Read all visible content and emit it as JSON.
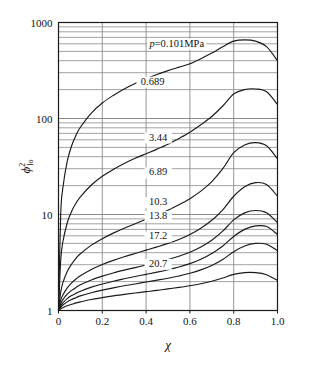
{
  "chart_data": {
    "type": "line",
    "title": "",
    "xlabel": "x",
    "ylabel": "phi^2_lo",
    "xlabel_glyph": "χ",
    "ylabel_glyph": "ϕ",
    "ylabel_sup": "2",
    "ylabel_sub": "lo",
    "xlim": [
      0,
      1.0
    ],
    "ylim": [
      1,
      1000
    ],
    "yscale": "log",
    "xscale": "linear",
    "grid": true,
    "grid_minor": true,
    "legend_position": "inline-curve-labels",
    "xticks": [
      "0",
      "0.2",
      "0.4",
      "0.6",
      "0.8",
      "1.0"
    ],
    "xtick_values": [
      0,
      0.2,
      0.4,
      0.6,
      0.8,
      1.0
    ],
    "yticks": [
      "1",
      "10",
      "100",
      "1000"
    ],
    "ytick_values": [
      1,
      10,
      100,
      1000
    ],
    "x": [
      0,
      0.01,
      0.02,
      0.04,
      0.06,
      0.08,
      0.1,
      0.15,
      0.2,
      0.25,
      0.3,
      0.35,
      0.4,
      0.45,
      0.5,
      0.55,
      0.6,
      0.65,
      0.7,
      0.75,
      0.8,
      0.85,
      0.9,
      0.95,
      1.0
    ],
    "series": [
      {
        "name": "p=0.101MPa",
        "label": "p=0.101MPa",
        "label_x": 0.54,
        "label_y": 560,
        "values": [
          1,
          10,
          19,
          36,
          52,
          67,
          81,
          114,
          145,
          174,
          203,
          231,
          259,
          287,
          315,
          343,
          372,
          420,
          480,
          560,
          640,
          660,
          640,
          560,
          400
        ]
      },
      {
        "name": "0.689",
        "label": "0.689",
        "label_x": 0.43,
        "label_y": 225,
        "values": [
          1,
          3.3,
          5.2,
          8.2,
          10.8,
          13.1,
          15.3,
          20.3,
          25.0,
          29.5,
          34.0,
          38.5,
          43.0,
          48.0,
          54.0,
          62.0,
          72.0,
          86.0,
          105.0,
          135.0,
          180.0,
          200.0,
          203.0,
          190.0,
          140.0
        ]
      },
      {
        "name": "3.44",
        "label": "3.44",
        "label_x": 0.455,
        "label_y": 59,
        "values": [
          1,
          1.55,
          1.95,
          2.55,
          3.05,
          3.5,
          3.9,
          4.8,
          5.6,
          6.4,
          7.2,
          8.0,
          8.9,
          9.9,
          11.1,
          12.6,
          14.6,
          17.5,
          22.0,
          30.0,
          44.0,
          53.0,
          56.0,
          52.0,
          38.0
        ]
      },
      {
        "name": "6.89",
        "label": "6.89",
        "label_x": 0.455,
        "label_y": 25.5,
        "values": [
          1,
          1.28,
          1.45,
          1.72,
          1.94,
          2.13,
          2.3,
          2.68,
          3.02,
          3.33,
          3.63,
          3.93,
          4.25,
          4.6,
          5.0,
          5.5,
          6.2,
          7.2,
          8.7,
          11.2,
          15.5,
          19.5,
          21.5,
          20.5,
          15.5
        ]
      },
      {
        "name": "10.3",
        "label": "10.3",
        "label_x": 0.455,
        "label_y": 12.5,
        "values": [
          1,
          1.18,
          1.3,
          1.48,
          1.62,
          1.74,
          1.85,
          2.08,
          2.28,
          2.46,
          2.63,
          2.8,
          2.98,
          3.18,
          3.4,
          3.68,
          4.05,
          4.6,
          5.4,
          6.7,
          8.8,
          10.4,
          11.0,
          10.4,
          8.2
        ]
      },
      {
        "name": "13.8",
        "label": "13.8",
        "label_x": 0.455,
        "label_y": 9.0,
        "values": [
          1,
          1.12,
          1.2,
          1.33,
          1.43,
          1.51,
          1.59,
          1.75,
          1.89,
          2.02,
          2.14,
          2.26,
          2.38,
          2.51,
          2.66,
          2.84,
          3.08,
          3.42,
          3.92,
          4.7,
          5.9,
          7.0,
          7.6,
          7.5,
          6.2
        ]
      },
      {
        "name": "17.2",
        "label": "17.2",
        "label_x": 0.455,
        "label_y": 5.5,
        "values": [
          1,
          1.08,
          1.14,
          1.23,
          1.3,
          1.36,
          1.42,
          1.53,
          1.63,
          1.72,
          1.81,
          1.89,
          1.98,
          2.07,
          2.17,
          2.29,
          2.44,
          2.65,
          2.95,
          3.4,
          4.1,
          4.7,
          5.0,
          4.9,
          4.2
        ]
      },
      {
        "name": "20.7",
        "label": "20.7",
        "label_x": 0.455,
        "label_y": 2.85,
        "values": [
          1,
          1.04,
          1.07,
          1.12,
          1.16,
          1.2,
          1.23,
          1.3,
          1.36,
          1.42,
          1.47,
          1.52,
          1.57,
          1.62,
          1.68,
          1.74,
          1.81,
          1.9,
          2.02,
          2.18,
          2.38,
          2.48,
          2.48,
          2.36,
          2.05
        ]
      }
    ]
  },
  "colors": {
    "curve": "#1a1a1a",
    "grid": "#8a8a8a",
    "axis": "#1a1a1a",
    "background": "#ffffff",
    "text": "#111111"
  }
}
